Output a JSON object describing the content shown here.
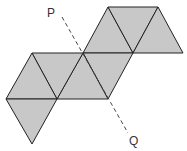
{
  "diagram": {
    "fill_color": "#c8c8c8",
    "stroke_color": "#222222",
    "labels": {
      "p": "P",
      "q": "Q"
    },
    "triangle_count": 8
  }
}
